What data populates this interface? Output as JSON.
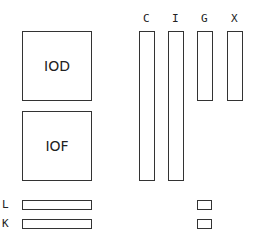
{
  "blocks": {
    "iod": "IOD",
    "iof": "IOF"
  },
  "columns": [
    "C",
    "I",
    "G",
    "X"
  ],
  "rows": [
    "L",
    "K"
  ]
}
